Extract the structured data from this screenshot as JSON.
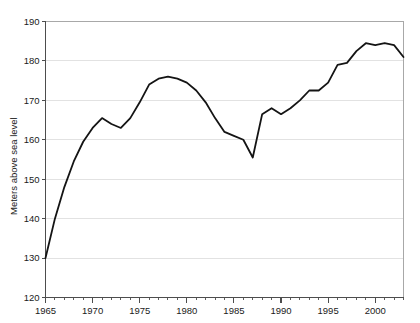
{
  "chart_data": {
    "type": "line",
    "title": "",
    "xlabel": "",
    "ylabel": "Meters above sea level",
    "xlim": [
      1965,
      2003
    ],
    "ylim": [
      120,
      190
    ],
    "grid": true,
    "legend": false,
    "y_ticks": [
      120,
      130,
      140,
      150,
      160,
      170,
      180,
      190
    ],
    "y_tick_labels": [
      "120",
      "130",
      "140",
      "150",
      "160",
      "170",
      "180",
      "190"
    ],
    "x_ticks": [
      1965,
      1970,
      1975,
      1980,
      1985,
      1990,
      1995,
      2000
    ],
    "x_tick_labels": [
      "1965",
      "1970",
      "1975",
      "1980",
      "1985",
      "1990",
      "1995",
      "2000"
    ],
    "x_minor_tick_step": 1,
    "series": [
      {
        "name": "Water level",
        "color": "#141414",
        "x": [
          1965,
          1966,
          1967,
          1968,
          1969,
          1970,
          1971,
          1972,
          1973,
          1974,
          1975,
          1976,
          1977,
          1978,
          1979,
          1980,
          1981,
          1982,
          1983,
          1984,
          1985,
          1986,
          1987,
          1988,
          1989,
          1990,
          1991,
          1992,
          1993,
          1994,
          1995,
          1996,
          1997,
          1998,
          1999,
          2000,
          2001,
          2002,
          2003
        ],
        "values": [
          130.0,
          140.0,
          148.0,
          154.5,
          159.5,
          163.0,
          165.5,
          164.0,
          163.0,
          165.5,
          169.5,
          174.0,
          175.5,
          176.0,
          175.5,
          174.5,
          172.5,
          169.5,
          165.5,
          162.0,
          161.0,
          160.0,
          155.5,
          166.5,
          168.0,
          166.5,
          168.0,
          170.0,
          172.5,
          172.5,
          174.5,
          179.0,
          179.5,
          182.5,
          184.5,
          184.0,
          184.5,
          184.0,
          181.0
        ]
      }
    ]
  },
  "axis": {
    "y_axis_title": "Meters above sea level"
  }
}
